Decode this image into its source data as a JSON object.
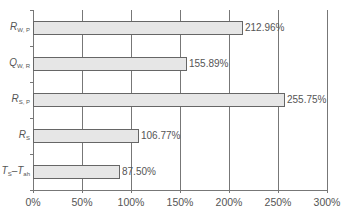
{
  "chart_data": {
    "type": "bar",
    "orientation": "horizontal",
    "title": "",
    "xlabel": "",
    "ylabel": "",
    "categories": [
      "R_W,P",
      "Q_W,R",
      "R_S,P",
      "R_S",
      "T_S-T_ah"
    ],
    "category_display": [
      {
        "main": "R",
        "sub": "W, P"
      },
      {
        "main": "Q",
        "sub": "W, R"
      },
      {
        "main": "R",
        "sub": "S, P"
      },
      {
        "main": "R",
        "sub": "S"
      },
      {
        "main": "T",
        "sub": "S",
        "main2": "–T",
        "sub2": "ah"
      }
    ],
    "values": [
      212.96,
      155.89,
      255.75,
      106.77,
      87.5
    ],
    "value_labels": [
      "212.96%",
      "155.89%",
      "255.75%",
      "106.77%",
      "87.50%"
    ],
    "xlim": [
      0,
      300
    ],
    "xticks": [
      0,
      50,
      100,
      150,
      200,
      250,
      300
    ],
    "xtick_labels": [
      "0%",
      "50%",
      "100%",
      "150%",
      "200%",
      "250%",
      "300%"
    ],
    "grid": true,
    "legend": null,
    "bar_color": "#e6e6e6",
    "bar_edge_color": "#666666"
  }
}
